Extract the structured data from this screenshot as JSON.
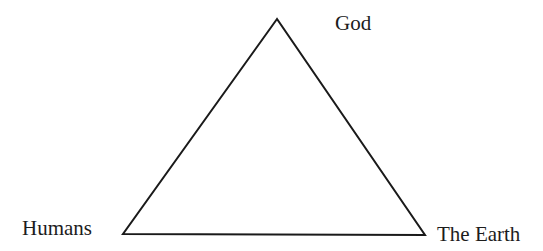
{
  "diagram": {
    "type": "triangle",
    "stroke_color": "#1a1a1a",
    "background": "#ffffff",
    "vertices": {
      "top": {
        "x": 277,
        "y": 19
      },
      "bottom_left": {
        "x": 123,
        "y": 234
      },
      "bottom_right": {
        "x": 425,
        "y": 235
      }
    },
    "nodes": [
      {
        "id": "god",
        "label": "God",
        "position": "top"
      },
      {
        "id": "humans",
        "label": "Humans",
        "position": "bottom-left"
      },
      {
        "id": "earth",
        "label": "The Earth",
        "position": "bottom-right"
      }
    ]
  }
}
